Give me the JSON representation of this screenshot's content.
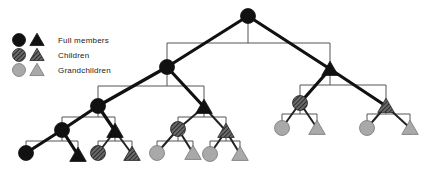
{
  "legend": {
    "items": [
      {
        "label": "Full members",
        "fill": "#111111",
        "pattern": "solid"
      },
      {
        "label": "Children",
        "fill": "#3a3a3a",
        "pattern": "hatched"
      },
      {
        "label": "Grandchildren",
        "fill": "#a8a8a8",
        "pattern": "gray"
      }
    ]
  },
  "colors": {
    "full": "#111111",
    "hatched_base": "#555555",
    "hatched_line": "#222222",
    "grand": "#a9a9a9",
    "thin_line": "#555555",
    "thick_line": "#111111"
  },
  "tree": {
    "nodes": [
      {
        "id": "n0",
        "shape": "circle",
        "type": "full",
        "x": 248,
        "y": 16
      },
      {
        "id": "n1",
        "shape": "circle",
        "type": "full",
        "x": 167,
        "y": 67
      },
      {
        "id": "n2",
        "shape": "triangle",
        "type": "full",
        "x": 330,
        "y": 69
      },
      {
        "id": "n3",
        "shape": "circle",
        "type": "full",
        "x": 98,
        "y": 106
      },
      {
        "id": "n4",
        "shape": "triangle",
        "type": "full",
        "x": 204,
        "y": 107
      },
      {
        "id": "n5",
        "shape": "circle",
        "type": "hatched",
        "x": 300,
        "y": 103
      },
      {
        "id": "n6",
        "shape": "triangle",
        "type": "hatched",
        "x": 386,
        "y": 106
      },
      {
        "id": "n7",
        "shape": "circle",
        "type": "full",
        "x": 62,
        "y": 130
      },
      {
        "id": "n8",
        "shape": "triangle",
        "type": "full",
        "x": 115,
        "y": 131
      },
      {
        "id": "n9",
        "shape": "circle",
        "type": "hatched",
        "x": 178,
        "y": 129
      },
      {
        "id": "n10",
        "shape": "triangle",
        "type": "hatched",
        "x": 226,
        "y": 131
      },
      {
        "id": "n11",
        "shape": "circle",
        "type": "grand",
        "x": 282,
        "y": 128
      },
      {
        "id": "n12",
        "shape": "triangle",
        "type": "grand",
        "x": 317,
        "y": 128
      },
      {
        "id": "n13",
        "shape": "circle",
        "type": "grand",
        "x": 367,
        "y": 128
      },
      {
        "id": "n14",
        "shape": "triangle",
        "type": "grand",
        "x": 410,
        "y": 128
      },
      {
        "id": "n15",
        "shape": "circle",
        "type": "full",
        "x": 26,
        "y": 153
      },
      {
        "id": "n16",
        "shape": "triangle",
        "type": "full",
        "x": 78,
        "y": 155
      },
      {
        "id": "n17",
        "shape": "circle",
        "type": "hatched",
        "x": 98,
        "y": 153
      },
      {
        "id": "n18",
        "shape": "triangle",
        "type": "hatched",
        "x": 132,
        "y": 154
      },
      {
        "id": "n19",
        "shape": "circle",
        "type": "grand",
        "x": 157,
        "y": 153
      },
      {
        "id": "n20",
        "shape": "triangle",
        "type": "grand",
        "x": 193,
        "y": 153
      },
      {
        "id": "n21",
        "shape": "circle",
        "type": "grand",
        "x": 210,
        "y": 154
      },
      {
        "id": "n22",
        "shape": "triangle",
        "type": "grand",
        "x": 240,
        "y": 154
      }
    ],
    "families": [
      {
        "parent": "n0",
        "children": [
          "n1",
          "n2"
        ],
        "bracket_y": 43
      },
      {
        "parent": "n1",
        "children": [
          "n3",
          "n4"
        ],
        "bracket_y": 86
      },
      {
        "parent": "n2",
        "children": [
          "n5",
          "n6"
        ],
        "bracket_y": 85
      },
      {
        "parent": "n3",
        "children": [
          "n7",
          "n8"
        ],
        "bracket_y": 117
      },
      {
        "parent": "n4",
        "children": [
          "n9",
          "n10"
        ],
        "bracket_y": 117
      },
      {
        "parent": "n5",
        "children": [
          "n11",
          "n12"
        ],
        "bracket_y": 114
      },
      {
        "parent": "n6",
        "children": [
          "n13",
          "n14"
        ],
        "bracket_y": 114
      },
      {
        "parent": "n7",
        "children": [
          "n15",
          "n16"
        ],
        "bracket_y": 141
      },
      {
        "parent": "n8",
        "children": [
          "n17",
          "n18"
        ],
        "bracket_y": 141
      },
      {
        "parent": "n9",
        "children": [
          "n19",
          "n20"
        ],
        "bracket_y": 141
      },
      {
        "parent": "n10",
        "children": [
          "n21",
          "n22"
        ],
        "bracket_y": 141
      }
    ],
    "thick_edges": [
      [
        "n0",
        "n1"
      ],
      [
        "n0",
        "n2"
      ],
      [
        "n1",
        "n3"
      ],
      [
        "n1",
        "n4"
      ],
      [
        "n2",
        "n5"
      ],
      [
        "n2",
        "n6"
      ],
      [
        "n3",
        "n7"
      ],
      [
        "n3",
        "n8"
      ],
      [
        "n7",
        "n15"
      ],
      [
        "n7",
        "n16"
      ]
    ],
    "thin_diag_edges": [
      [
        "n4",
        "n9"
      ],
      [
        "n4",
        "n10"
      ],
      [
        "n8",
        "n17"
      ],
      [
        "n8",
        "n18"
      ],
      [
        "n5",
        "n11"
      ],
      [
        "n5",
        "n12"
      ],
      [
        "n6",
        "n13"
      ],
      [
        "n6",
        "n14"
      ],
      [
        "n9",
        "n19"
      ],
      [
        "n9",
        "n20"
      ],
      [
        "n10",
        "n21"
      ],
      [
        "n10",
        "n22"
      ]
    ]
  }
}
